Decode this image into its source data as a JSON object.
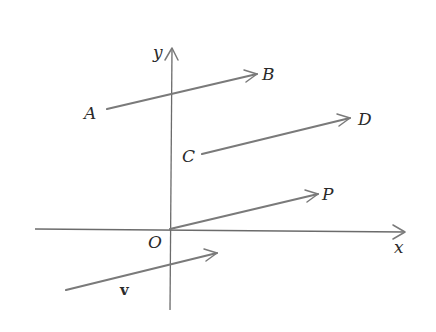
{
  "diagram": {
    "type": "vector-translation-diagram",
    "colors": {
      "background": "#ffffff",
      "axis": "#6b6b6b",
      "vector": "#7a7a7a",
      "label": "#2a2a2a"
    },
    "axes": {
      "x_label": "x",
      "y_label": "y",
      "origin_label": "O",
      "origin_px": [
        170,
        229
      ],
      "x_axis": {
        "from": [
          35,
          229
        ],
        "to": [
          405,
          232
        ]
      },
      "y_axis": {
        "from": [
          170,
          310
        ],
        "to": [
          172,
          48
        ]
      }
    },
    "vectors": [
      {
        "name": "AB",
        "start_label": "A",
        "end_label": "B",
        "from": [
          107,
          109
        ],
        "to": [
          257,
          74
        ]
      },
      {
        "name": "CD",
        "start_label": "C",
        "end_label": "D",
        "from": [
          202,
          154
        ],
        "to": [
          350,
          118
        ]
      },
      {
        "name": "OP",
        "start_label": "O",
        "end_label": "P",
        "from": [
          170,
          229
        ],
        "to": [
          318,
          194
        ]
      },
      {
        "name": "v",
        "start_label": "",
        "end_label": "",
        "from": [
          66,
          290
        ],
        "to": [
          217,
          253
        ],
        "label": "v"
      }
    ],
    "labels": {
      "A": "A",
      "B": "B",
      "C": "C",
      "D": "D",
      "P": "P",
      "O": "O",
      "x": "x",
      "y": "y",
      "v": "v"
    }
  }
}
